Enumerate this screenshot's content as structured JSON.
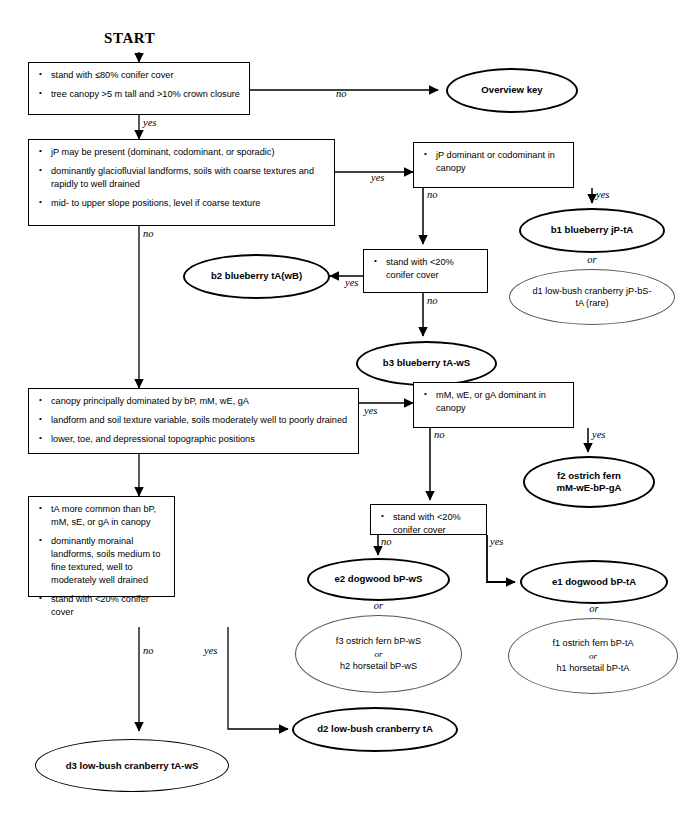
{
  "diagram": {
    "start_label": "START",
    "yes_label": "yes",
    "no_label": "no",
    "or_label": "or"
  },
  "boxes": {
    "b_start": {
      "items": [
        "stand with ≤80% conifer cover",
        "tree canopy >5 m tall and >10% crown closure"
      ]
    },
    "b_jp": {
      "items": [
        "jP may be present (dominant, codominant, or sporadic)",
        "dominantly glaciofluvial landforms, soils with coarse textures and rapidly to well drained",
        "mid- to upper slope positions, level if coarse texture"
      ]
    },
    "b_jp_dom": {
      "items": [
        "jP dominant or codominant in canopy"
      ]
    },
    "b_conifer20_a": {
      "items": [
        "stand with <20% conifer cover"
      ]
    },
    "b_bp": {
      "items": [
        "canopy principally dominated by bP, mM, wE, gA",
        "landform and soil texture variable, soils moderately well to poorly drained",
        "lower, toe, and depressional topographic positions"
      ]
    },
    "b_mm_dom": {
      "items": [
        "mM, wE, or gA dominant in canopy"
      ]
    },
    "b_conifer20_b": {
      "items": [
        "stand with <20% conifer cover"
      ]
    },
    "b_ta": {
      "items": [
        "tA more common than bP, mM, sE, or gA in canopy",
        "dominantly morainal landforms, soils medium to fine textured, well to moderately well drained",
        "stand with <20% conifer cover"
      ]
    }
  },
  "ovals": {
    "overview_key": {
      "lines": [
        "Overview key"
      ]
    },
    "b1": {
      "lines": [
        "b1  blueberry jP-tA"
      ]
    },
    "d1": {
      "lines": [
        "d1  low-bush cranberry jP-bS-",
        "tA (rare)"
      ]
    },
    "b2": {
      "lines": [
        "b2  blueberry tA(wB)"
      ]
    },
    "b3": {
      "lines": [
        "b3  blueberry tA-wS"
      ]
    },
    "f2": {
      "lines": [
        "f2  ostrich fern",
        "mM-wE-bP-gA"
      ]
    },
    "e1": {
      "lines": [
        "e1  dogwood bP-tA"
      ]
    },
    "f1h1": {
      "lines": [
        "f1  ostrich fern bP-tA",
        "or",
        "h1  horsetail bP-tA"
      ]
    },
    "e2": {
      "lines": [
        "e2  dogwood bP-wS"
      ]
    },
    "f3h2": {
      "lines": [
        "f3  ostrich fern bP-wS",
        "or",
        "h2  horsetail bP-wS"
      ]
    },
    "d2": {
      "lines": [
        "d2  low-bush cranberry tA"
      ]
    },
    "d3": {
      "lines": [
        "d3  low-bush cranberry tA-wS"
      ]
    }
  },
  "colors": {
    "stroke": "#000000",
    "thin_stroke": "#555555",
    "background": "#ffffff"
  }
}
